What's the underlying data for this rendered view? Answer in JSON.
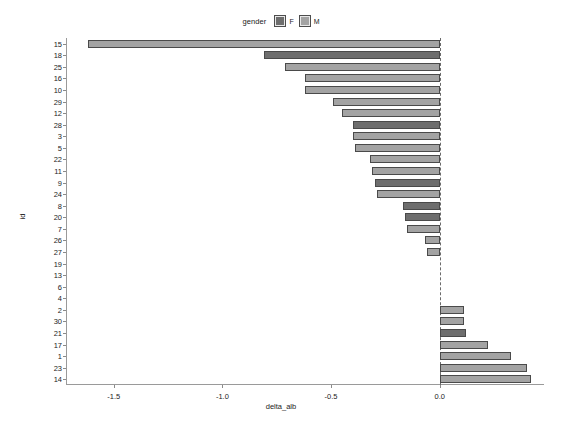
{
  "legend": {
    "title": "gender",
    "entries": [
      {
        "label": "F",
        "color": "#6e6e6e"
      },
      {
        "label": "M",
        "color": "#a3a3a3"
      }
    ]
  },
  "axes": {
    "x_title": "delta_alb",
    "y_title": "id",
    "x_ticks": [
      "-1.5",
      "-1.0",
      "-0.5",
      "0.0"
    ]
  },
  "chart_data": {
    "type": "bar",
    "orientation": "horizontal",
    "title": "",
    "xlabel": "delta_alb",
    "ylabel": "id",
    "xlim": [
      -1.72,
      0.48
    ],
    "xticks": [
      -1.5,
      -1.0,
      -0.5,
      0.0
    ],
    "grid": false,
    "legend_title": "gender",
    "legend_position": "top",
    "reference_line": {
      "x": 0.0,
      "style": "dashed"
    },
    "categories": [
      "15",
      "18",
      "25",
      "16",
      "10",
      "29",
      "12",
      "28",
      "3",
      "5",
      "22",
      "11",
      "9",
      "24",
      "8",
      "20",
      "7",
      "26",
      "27",
      "19",
      "13",
      "6",
      "4",
      "2",
      "30",
      "21",
      "17",
      "1",
      "23",
      "14"
    ],
    "values": [
      -1.62,
      -0.81,
      -0.71,
      -0.62,
      -0.62,
      -0.49,
      -0.45,
      -0.4,
      -0.4,
      -0.39,
      -0.32,
      -0.31,
      -0.3,
      -0.29,
      -0.17,
      -0.16,
      -0.15,
      -0.07,
      -0.06,
      0.0,
      0.0,
      0.0,
      0.0,
      0.11,
      0.11,
      0.12,
      0.22,
      0.33,
      0.4,
      0.42
    ],
    "groups": [
      "M",
      "F",
      "M",
      "M",
      "M",
      "M",
      "M",
      "F",
      "M",
      "M",
      "M",
      "M",
      "F",
      "M",
      "F",
      "F",
      "M",
      "M",
      "M",
      "M",
      "M",
      "M",
      "M",
      "M",
      "M",
      "F",
      "M",
      "M",
      "M",
      "M"
    ],
    "group_colors": {
      "F": "#6e6e6e",
      "M": "#a3a3a3"
    }
  }
}
